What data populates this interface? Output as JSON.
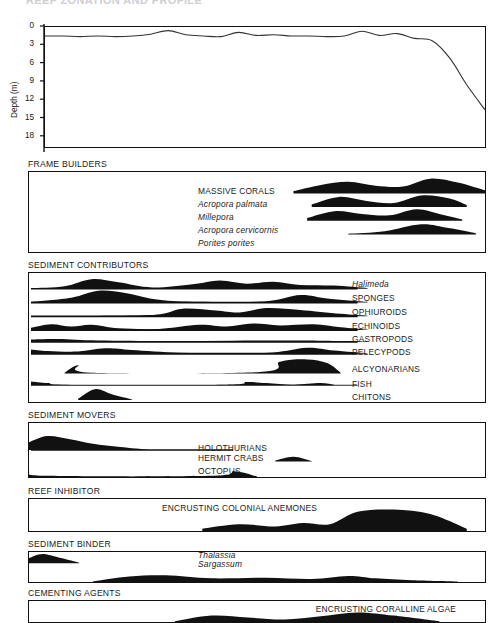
{
  "figure": {
    "title_clipped": "REEF ZONATION AND PROFILE",
    "width": 490,
    "height": 623,
    "ink_color": "#111111",
    "background": "#ffffff"
  },
  "depth_chart": {
    "ylabel": "Depth (m)",
    "ticks": [
      "0",
      "3",
      "6",
      "9",
      "12",
      "15",
      "18"
    ]
  },
  "sections": [
    {
      "label": "FRAME BUILDERS"
    },
    {
      "label": "SEDIMENT CONTRIBUTORS"
    },
    {
      "label": "SEDIMENT MOVERS"
    },
    {
      "label": "REEF INHIBITOR"
    },
    {
      "label": "SEDIMENT BINDER"
    },
    {
      "label": "CEMENTING AGENTS"
    }
  ],
  "frame_builders": [
    {
      "name": "MASSIVE CORALS",
      "italic": false
    },
    {
      "name": "Acropora palmata",
      "italic": true
    },
    {
      "name": "Millepora",
      "italic": true
    },
    {
      "name": "Acropora cervicornis",
      "italic": true
    },
    {
      "name": "Porites porites",
      "italic": true
    }
  ],
  "sediment_contributors": [
    {
      "name": "Halimeda",
      "italic": true
    },
    {
      "name": "SPONGES",
      "italic": false
    },
    {
      "name": "OPHIUROIDS",
      "italic": false
    },
    {
      "name": "ECHINOIDS",
      "italic": false
    },
    {
      "name": "GASTROPODS",
      "italic": false
    },
    {
      "name": "PELECYPODS",
      "italic": false
    },
    {
      "name": "ALCYONARIANS",
      "italic": false
    },
    {
      "name": "FISH",
      "italic": false
    },
    {
      "name": "CHITONS",
      "italic": false
    }
  ],
  "sediment_movers": [
    {
      "name": "HOLOTHURIANS",
      "italic": false
    },
    {
      "name": "HERMIT CRABS",
      "italic": false
    },
    {
      "name": "OCTOPUS",
      "italic": false
    }
  ],
  "reef_inhibitor": [
    {
      "name": "ENCRUSTING COLONIAL ANEMONES",
      "italic": false
    }
  ],
  "sediment_binder": [
    {
      "name": "Thalassia",
      "italic": true
    },
    {
      "name": "Sargassum",
      "italic": true
    }
  ],
  "cementing_agents": [
    {
      "name": "ENCRUSTING CORALLINE ALGAE",
      "italic": false
    }
  ],
  "chart_data": {
    "type": "area",
    "xlabel": "",
    "ylabel": "Depth (m)",
    "ylim": [
      0,
      20
    ],
    "yticks": [
      0,
      3,
      6,
      9,
      12,
      15,
      18
    ],
    "y_inverted": true,
    "grid": false,
    "legend": "none",
    "x_note": "Horizontal axis is distance across the reef (shore at left, fore-reef slope at right); unlabeled.",
    "series": [
      {
        "name": "Bottom depth profile",
        "x": [
          0,
          4,
          8,
          12,
          16,
          20,
          24,
          28,
          32,
          36,
          40,
          44,
          48,
          52,
          56,
          60,
          64,
          68,
          72,
          76,
          80,
          84,
          88,
          92,
          96,
          100
        ],
        "values": [
          1.5,
          1.5,
          1.6,
          1.5,
          1.6,
          1.5,
          1.2,
          0.6,
          1.3,
          1.5,
          1.6,
          0.9,
          1.4,
          1.3,
          1.5,
          1.5,
          1.6,
          1.5,
          0.7,
          1.4,
          1.1,
          1.9,
          2.3,
          5.2,
          9.8,
          13.8
        ]
      }
    ],
    "kite_panels": [
      {
        "panel": "FRAME BUILDERS",
        "taxa": [
          {
            "name": "MASSIVE CORALS",
            "x": [
              58,
              64,
              70,
              76,
              82,
              88,
              94,
              100
            ],
            "abundance": [
              0.15,
              0.55,
              0.75,
              0.5,
              0.45,
              0.95,
              0.7,
              0.2
            ]
          },
          {
            "name": "Acropora palmata",
            "x": [
              62,
              68,
              74,
              80,
              86,
              92,
              96
            ],
            "abundance": [
              0.2,
              0.75,
              0.45,
              0.3,
              0.85,
              0.65,
              0.15
            ]
          },
          {
            "name": "Millepora",
            "x": [
              61,
              67,
              73,
              79,
              85,
              90,
              95
            ],
            "abundance": [
              0.2,
              0.7,
              0.5,
              0.4,
              0.85,
              0.5,
              0.1
            ]
          },
          {
            "name": "Acropora cervicornis",
            "x": [
              70,
              78,
              86,
              92,
              98
            ],
            "abundance": [
              0.05,
              0.25,
              0.8,
              0.5,
              0.1
            ]
          },
          {
            "name": "Porites porites",
            "x": [],
            "abundance": []
          }
        ]
      },
      {
        "panel": "SEDIMENT CONTRIBUTORS",
        "taxa": [
          {
            "name": "Halimeda",
            "x": [
              0,
              10,
              18,
              26,
              36,
              48,
              56,
              64,
              72,
              80,
              90,
              100
            ],
            "abundance": [
              0.05,
              0.2,
              0.75,
              0.5,
              0.1,
              0.35,
              0.65,
              0.4,
              0.55,
              0.3,
              0.25,
              0.05
            ]
          },
          {
            "name": "SPONGES",
            "x": [
              0,
              12,
              20,
              28,
              38,
              50,
              70,
              80,
              88,
              100
            ],
            "abundance": [
              0.05,
              0.35,
              0.85,
              0.7,
              0.2,
              0.05,
              0.1,
              0.55,
              0.3,
              0.05
            ]
          },
          {
            "name": "OPHIUROIDS",
            "x": [
              0,
              35,
              45,
              55,
              62,
              70,
              80,
              92,
              100
            ],
            "abundance": [
              0.02,
              0.1,
              0.6,
              0.45,
              0.3,
              0.65,
              0.5,
              0.2,
              0.05
            ]
          },
          {
            "name": "ECHINOIDS",
            "x": [
              0,
              6,
              12,
              18,
              26,
              38,
              50,
              58,
              66,
              74,
              84,
              92,
              100
            ],
            "abundance": [
              0.2,
              0.5,
              0.3,
              0.45,
              0.15,
              0.1,
              0.45,
              0.3,
              0.55,
              0.4,
              0.5,
              0.25,
              0.05
            ]
          },
          {
            "name": "GASTROPODS",
            "x": [
              0,
              8,
              20,
              40,
              60,
              80,
              100
            ],
            "abundance": [
              0.25,
              0.3,
              0.15,
              0.1,
              0.12,
              0.15,
              0.05
            ]
          },
          {
            "name": "PELECYPODS",
            "x": [
              0,
              5,
              14,
              22,
              30,
              44,
              58,
              72,
              82,
              90,
              100
            ],
            "abundance": [
              0.4,
              0.25,
              0.2,
              0.5,
              0.35,
              0.1,
              0.08,
              0.12,
              0.55,
              0.3,
              0.05
            ]
          },
          {
            "name": "ALCYONARIANS",
            "x": [
              10,
              14,
              18,
              68,
              74,
              82,
              88,
              92
            ],
            "abundance": [
              0.05,
              0.55,
              0.05,
              0.1,
              0.8,
              0.95,
              0.7,
              0.05
            ]
          },
          {
            "name": "FISH",
            "x": [
              0,
              5,
              12,
              58,
              64,
              70,
              78,
              86,
              90
            ],
            "abundance": [
              0.35,
              0.2,
              0.03,
              0.05,
              0.3,
              0.2,
              0.05,
              0.2,
              0.05
            ]
          },
          {
            "name": "CHITONS",
            "x": [
              14,
              19,
              24,
              30
            ],
            "abundance": [
              0.1,
              0.85,
              0.45,
              0.05
            ]
          }
        ]
      },
      {
        "panel": "SEDIMENT MOVERS",
        "taxa": [
          {
            "name": "HOLOTHURIANS",
            "x": [
              0,
              4,
              9,
              14,
              20,
              26
            ],
            "abundance": [
              0.5,
              0.9,
              0.7,
              0.4,
              0.2,
              0.03
            ]
          },
          {
            "name": "HERMIT CRABS",
            "x": [
              54,
              58,
              62
            ],
            "abundance": [
              0.1,
              0.5,
              0.05
            ]
          },
          {
            "name": "OCTOPUS",
            "x": [
              0,
              4,
              40,
              45,
              50
            ],
            "abundance": [
              0.45,
              0.1,
              0.1,
              0.5,
              0.05
            ]
          }
        ]
      },
      {
        "panel": "REEF INHIBITOR",
        "taxa": [
          {
            "name": "ENCRUSTING COLONIAL ANEMONES",
            "x": [
              38,
              46,
              54,
              60,
              66,
              72,
              80,
              88,
              96
            ],
            "abundance": [
              0.1,
              0.3,
              0.2,
              0.35,
              0.3,
              0.85,
              0.95,
              0.75,
              0.1
            ]
          }
        ]
      },
      {
        "panel": "SEDIMENT BINDER",
        "taxa": [
          {
            "name": "Thalassia",
            "x": [
              0,
              3,
              7,
              11
            ],
            "abundance": [
              0.5,
              0.9,
              0.5,
              0.05
            ]
          },
          {
            "name": "Sargassum",
            "x": [
              14,
              22,
              30,
              40,
              52,
              62,
              70,
              76,
              84,
              94
            ],
            "abundance": [
              0.05,
              0.45,
              0.55,
              0.3,
              0.35,
              0.25,
              0.5,
              0.3,
              0.15,
              0.05
            ]
          }
        ]
      },
      {
        "panel": "CEMENTING AGENTS",
        "taxa": [
          {
            "name": "ENCRUSTING CORALLINE ALGAE",
            "x": [
              32,
              40,
              48,
              56,
              64,
              72,
              80,
              90
            ],
            "abundance": [
              0.05,
              0.5,
              0.35,
              0.2,
              0.45,
              0.75,
              0.5,
              0.05
            ]
          }
        ]
      }
    ]
  }
}
